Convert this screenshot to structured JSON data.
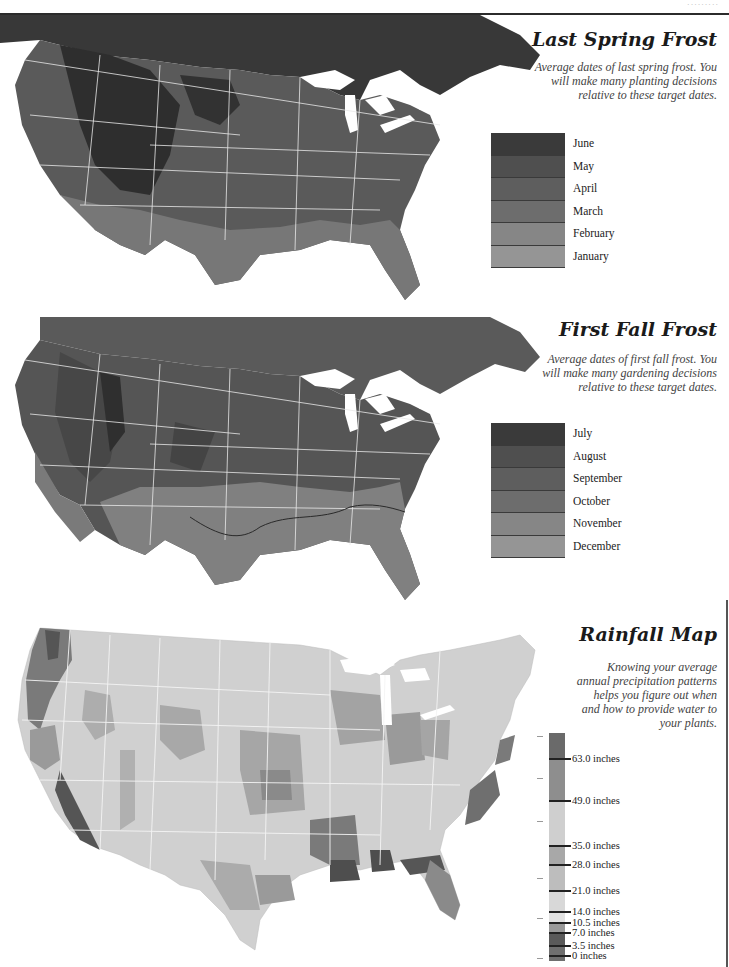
{
  "page": {
    "running_head": "·········"
  },
  "spring_frost": {
    "title": "Last Spring Frost",
    "description_lines": [
      "Average dates of last spring frost. You",
      "will make many planting decisions",
      "relative to these target dates."
    ],
    "legend": [
      {
        "label": "June",
        "color": "#3a3a3a"
      },
      {
        "label": "May",
        "color": "#4f4f4f"
      },
      {
        "label": "April",
        "color": "#5e5e5e"
      },
      {
        "label": "March",
        "color": "#6d6d6d"
      },
      {
        "label": "February",
        "color": "#868686"
      },
      {
        "label": "January",
        "color": "#959595"
      }
    ]
  },
  "fall_frost": {
    "title": "First Fall Frost",
    "description_lines": [
      "Average dates of first fall frost. You",
      "will make many gardening decisions",
      "relative to these target dates."
    ],
    "legend": [
      {
        "label": "July",
        "color": "#3a3a3a"
      },
      {
        "label": "August",
        "color": "#4f4f4f"
      },
      {
        "label": "September",
        "color": "#5e5e5e"
      },
      {
        "label": "October",
        "color": "#6d6d6d"
      },
      {
        "label": "November",
        "color": "#868686"
      },
      {
        "label": "December",
        "color": "#959595"
      }
    ]
  },
  "rainfall": {
    "title": "Rainfall Map",
    "description_lines": [
      "Knowing your average",
      "annual precipitation patterns",
      "helps you figure out when",
      "and how to provide water to",
      "your plants."
    ],
    "legend": [
      {
        "label": "63.0 inches",
        "pos": 25
      },
      {
        "label": "49.0 inches",
        "pos": 67
      },
      {
        "label": "35.0 inches",
        "pos": 112
      },
      {
        "label": "28.0 inches",
        "pos": 131
      },
      {
        "label": "21.0 inches",
        "pos": 157
      },
      {
        "label": "14.0 inches",
        "pos": 178
      },
      {
        "label": "10.5 inches",
        "pos": 189
      },
      {
        "label": "7.0 inches",
        "pos": 199
      },
      {
        "label": "3.5 inches",
        "pos": 212
      },
      {
        "label": "0 inches",
        "pos": 222
      }
    ],
    "segments": [
      {
        "from": 0,
        "to": 25,
        "color": "#6a6a6a"
      },
      {
        "from": 25,
        "to": 67,
        "color": "#8e8e8e"
      },
      {
        "from": 67,
        "to": 112,
        "color": "#cfcfcf"
      },
      {
        "from": 112,
        "to": 131,
        "color": "#a8a8a8"
      },
      {
        "from": 131,
        "to": 157,
        "color": "#bdbdbd"
      },
      {
        "from": 157,
        "to": 178,
        "color": "#d8d8d8"
      },
      {
        "from": 178,
        "to": 189,
        "color": "#e2e2e2"
      },
      {
        "from": 189,
        "to": 199,
        "color": "#9a9a9a"
      },
      {
        "from": 199,
        "to": 212,
        "color": "#5a5a5a"
      },
      {
        "from": 212,
        "to": 228,
        "color": "#6f6f6f"
      }
    ]
  }
}
